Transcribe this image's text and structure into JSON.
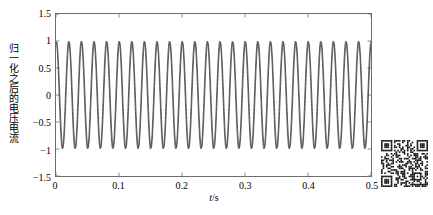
{
  "figure": {
    "background_color": "#ffffff",
    "axes_color": "#6d6d6d",
    "line_color": "#3a3a3a"
  },
  "ylabel_text": "归一化之后的电压电流",
  "xlabel_prefix": "t",
  "xlabel_suffix": "/s",
  "qr_code": {
    "name": "qr-code",
    "alt_text": "QR code"
  },
  "chart_data": {
    "type": "line",
    "title": "",
    "xlabel": "t/s",
    "ylabel": "归一化之后的电压电流",
    "xlim": [
      0,
      0.5
    ],
    "ylim": [
      -1.5,
      1.5
    ],
    "xticks": [
      0,
      0.1,
      0.2,
      0.3,
      0.4,
      0.5
    ],
    "xtick_labels": [
      "0",
      "0.1",
      "0.2",
      "0.3",
      "0.4",
      "0.5"
    ],
    "yticks": [
      1.5,
      1,
      0.5,
      0,
      -0.5,
      -1,
      -1.5
    ],
    "ytick_labels": [
      "1.5",
      "1",
      "0.5",
      "0",
      "−0.5",
      "−1",
      "−1.5"
    ],
    "grid": false,
    "legend": false,
    "legend_position": "none",
    "tick_direction": "in",
    "series": [
      {
        "name": "归一化电压",
        "waveform": "sine",
        "frequency_hz": 50,
        "amplitude": 1.0,
        "phase_deg": 90,
        "offset": 0,
        "color": "#3a3a3a",
        "linewidth": 0.8
      },
      {
        "name": "归一化电流",
        "waveform": "sine",
        "frequency_hz": 50,
        "amplitude": 0.98,
        "phase_deg": 72,
        "offset": 0,
        "color": "#3a3a3a",
        "linewidth": 0.8
      }
    ],
    "cycles_shown": 25,
    "sample_count": 2000,
    "annotations": []
  }
}
